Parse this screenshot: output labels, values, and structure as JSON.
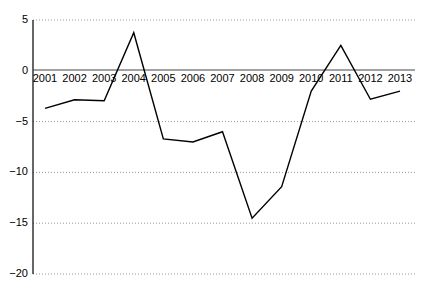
{
  "chart_data": {
    "type": "line",
    "title": "",
    "subtitle": "",
    "xlabel": "",
    "ylabel": "",
    "categories": [
      "2001",
      "2002",
      "2003",
      "2004",
      "2005",
      "2006",
      "2007",
      "2008",
      "2009",
      "2010",
      "2011",
      "2012",
      "2013"
    ],
    "values": [
      -3.7,
      -2.85,
      -2.95,
      3.75,
      -6.7,
      -7.0,
      -6.0,
      -14.5,
      -11.4,
      -2.0,
      2.5,
      -2.8,
      -2.0
    ],
    "series": [
      {
        "name": "",
        "values": [
          -3.7,
          -2.85,
          -2.95,
          3.75,
          -6.7,
          -7.0,
          -6.0,
          -14.5,
          -11.4,
          -2.0,
          2.5,
          -2.8,
          -2.0
        ],
        "color": "#000000"
      }
    ],
    "ylim": [
      -20,
      5
    ],
    "yticks": [
      5,
      0,
      -5,
      -10,
      -15,
      -20
    ],
    "ytick_labels": [
      "5",
      "0",
      "−5",
      "−10",
      "−15",
      "−20"
    ],
    "xtick_labels": [
      "2001",
      "2002",
      "2003",
      "2004",
      "2005",
      "2006",
      "2007",
      "2008",
      "2009",
      "2010",
      "2011",
      "2012",
      "2013"
    ],
    "grid": "horizontal-dotted",
    "legend": "none",
    "zero_line": true,
    "line_color": "#000000",
    "grid_color": "#999999",
    "axis_color": "#000000",
    "background_color": "#ffffff"
  },
  "axes": {
    "y_axis_name": "y-axis",
    "x_axis_name": "x-axis"
  }
}
